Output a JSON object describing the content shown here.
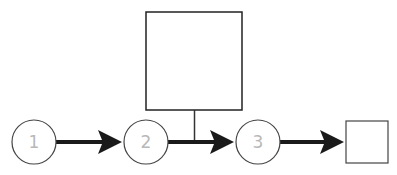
{
  "diagram": {
    "type": "flow",
    "nodes": [
      {
        "id": "n1",
        "shape": "circle",
        "label": "1"
      },
      {
        "id": "n2",
        "shape": "circle",
        "label": "2"
      },
      {
        "id": "n3",
        "shape": "circle",
        "label": "3"
      },
      {
        "id": "big-box",
        "shape": "rect",
        "label": ""
      },
      {
        "id": "small-box",
        "shape": "rect",
        "label": ""
      }
    ],
    "edges": [
      {
        "from": "n1",
        "to": "n2",
        "style": "thick-arrow"
      },
      {
        "from": "n2",
        "to": "n3",
        "style": "thick-arrow"
      },
      {
        "from": "n3",
        "to": "small-box",
        "style": "thick-arrow"
      },
      {
        "from": "big-box",
        "to": "edge-n2-n3",
        "style": "thin-line"
      }
    ],
    "colors": {
      "stroke": "#222222",
      "label": "#b8b8b8",
      "background": "#ffffff"
    }
  }
}
